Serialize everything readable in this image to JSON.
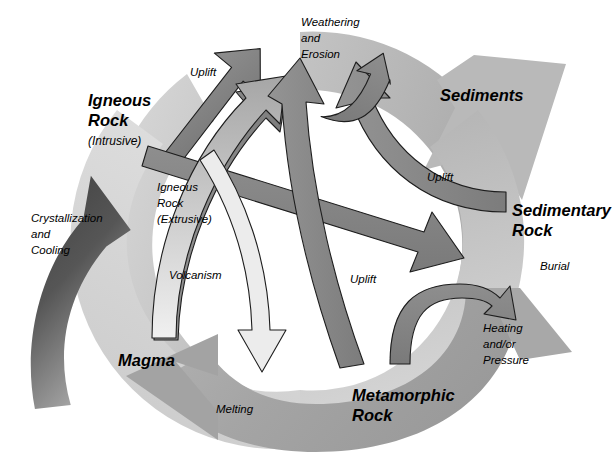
{
  "diagram": {
    "type": "cycle-diagram",
    "background": "#ffffff"
  },
  "colors": {
    "outer_ring_light": "#d3d3d3",
    "outer_ring_mid": "#b8b8b8",
    "outer_ring_dark": "#a0a0a0",
    "inner_ring_light": "#bdbdbd",
    "inner_ring_mid": "#a8a8a8",
    "crystallization_arrow_dark": "#4a4a4a",
    "crystallization_arrow_light": "#9a9a9a",
    "connector_arrow": "#8c8c8c",
    "connector_arrow_dark": "#6e6e6e",
    "connector_outline": "#1a1a1a",
    "text": "#000000"
  },
  "stages": [
    {
      "id": "igneous-rock",
      "label": "Igneous",
      "label2": "Rock",
      "sub": "(Intrusive)",
      "x": 88,
      "y": 92
    },
    {
      "id": "sediments",
      "label": "Sediments",
      "label2": "",
      "sub": "",
      "x": 440,
      "y": 96
    },
    {
      "id": "sedimentary-rock",
      "label": "Sedimentary",
      "label2": "Rock",
      "sub": "",
      "x": 512,
      "y": 205
    },
    {
      "id": "metamorphic-rock",
      "label": "Metamorphic",
      "label2": "Rock",
      "sub": "",
      "x": 352,
      "y": 391
    },
    {
      "id": "magma",
      "label": "Magma",
      "label2": "",
      "sub": "",
      "x": 118,
      "y": 356
    }
  ],
  "processes": [
    {
      "id": "crystallization-and-cooling",
      "lines": [
        "Crystallization",
        "and",
        "Cooling"
      ],
      "x": 31,
      "y": 213
    },
    {
      "id": "uplift-top-left",
      "lines": [
        "Uplift"
      ],
      "x": 190,
      "y": 67
    },
    {
      "id": "weathering-and-erosion",
      "lines": [
        "Weathering",
        "and",
        "Erosion"
      ],
      "x": 301,
      "y": 17
    },
    {
      "id": "uplift-right",
      "lines": [
        "Uplift"
      ],
      "x": 427,
      "y": 172
    },
    {
      "id": "burial",
      "lines": [
        "Burial"
      ],
      "x": 540,
      "y": 261
    },
    {
      "id": "heating-and-or-pressure",
      "lines": [
        "Heating",
        "and/or",
        "Pressure"
      ],
      "x": 483,
      "y": 323
    },
    {
      "id": "igneous-rock-extrusive",
      "lines": [
        "Igneous",
        "Rock",
        "(Extrusive)"
      ],
      "x": 157,
      "y": 182
    },
    {
      "id": "volcanism",
      "lines": [
        "Volcanism"
      ],
      "x": 169,
      "y": 270
    },
    {
      "id": "uplift-center",
      "lines": [
        "Uplift"
      ],
      "x": 350,
      "y": 274
    },
    {
      "id": "melting",
      "lines": [
        "Melting"
      ],
      "x": 216,
      "y": 404
    }
  ],
  "connectors": [
    {
      "id": "intrusive-to-weathering",
      "from": "igneous-rock",
      "to": "weathering-and-erosion"
    },
    {
      "id": "intrusive-to-sedimentary",
      "from": "igneous-rock",
      "to": "sedimentary-rock"
    },
    {
      "id": "magma-to-weathering",
      "from": "magma",
      "to": "weathering-and-erosion"
    },
    {
      "id": "magma-volcanism-up",
      "from": "magma",
      "to": "igneous-rock-extrusive"
    },
    {
      "id": "extrusive-down-to-melting",
      "from": "igneous-rock-extrusive",
      "to": "melting"
    },
    {
      "id": "metamorphic-to-weathering",
      "from": "metamorphic-rock",
      "to": "weathering-and-erosion"
    },
    {
      "id": "metamorphic-uplift",
      "from": "metamorphic-rock",
      "to": "heating-and-or-pressure"
    },
    {
      "id": "sedimentary-to-weathering",
      "from": "sedimentary-rock",
      "to": "weathering-and-erosion"
    },
    {
      "id": "sediments-loop",
      "from": "sediments",
      "to": "weathering-and-erosion"
    }
  ]
}
